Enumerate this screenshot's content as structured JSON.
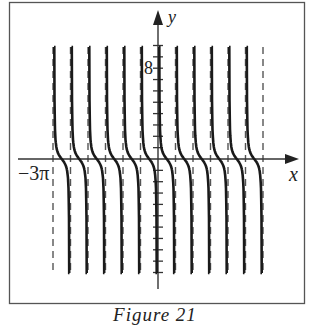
{
  "figure": {
    "caption": "Figure 21",
    "x_axis_label": "x",
    "y_axis_label": "y",
    "x_tick_label": "−3π",
    "y_tick_label": "8",
    "colors": {
      "curve": "#1a1a1a",
      "axis": "#333333",
      "asymptote": "#555555",
      "frame": "#555555"
    }
  },
  "chart_data": {
    "type": "line",
    "title": "",
    "caption": "Figure 21",
    "xlabel": "x",
    "ylabel": "y",
    "function_shape": "cotangent-like branches, decreasing from +inf to -inf between consecutive vertical asymptotes",
    "xlim": [
      "-3π",
      "3π"
    ],
    "ylim": [
      -10,
      10
    ],
    "labeled_ticks": {
      "x": [
        "-3π"
      ],
      "y": [
        8
      ]
    },
    "y_tick_spacing": 1,
    "asymptote_spacing": "π/2",
    "asymptotes_x": [
      "-3π",
      "-5π/2",
      "-2π",
      "-3π/2",
      "-π",
      "-π/2",
      "0",
      "π/2",
      "π",
      "3π/2",
      "2π",
      "5π/2",
      "3π"
    ],
    "branches": 12,
    "zeros_x": [
      "-11π/4",
      "-9π/4",
      "-7π/4",
      "-5π/4",
      "-3π/4",
      "-π/4",
      "π/4",
      "3π/4",
      "5π/4",
      "7π/4",
      "9π/4",
      "11π/4"
    ],
    "grid": false,
    "legend": null
  }
}
